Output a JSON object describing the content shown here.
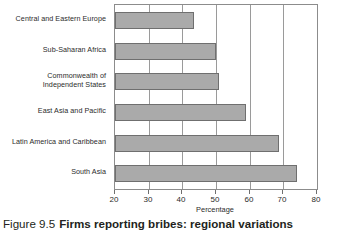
{
  "caption": {
    "number": "Figure 9.5",
    "text": "Firms reporting bribes: regional variations"
  },
  "chart_data": {
    "type": "bar",
    "orientation": "horizontal",
    "title": "",
    "xlabel": "Percentage",
    "ylabel": "",
    "xlim": [
      20,
      80
    ],
    "xticks": [
      20,
      30,
      40,
      50,
      60,
      70,
      80
    ],
    "xticklabels": [
      "20",
      "30",
      "40",
      "50",
      "60",
      "70",
      "80"
    ],
    "grid": true,
    "grid_axis": "x",
    "legend": false,
    "bar_color": "#aaaaaa",
    "bar_edge_color": "#6f6f6f",
    "categories": [
      "Central and Eastern Europe",
      "Sub-Saharan Africa",
      "Commonwealth of Independent States",
      "East Asia and Pacific",
      "Latin America and Caribbean",
      "South Asia"
    ],
    "category_lines": [
      [
        "Central and Eastern Europe"
      ],
      [
        "Sub-Saharan Africa"
      ],
      [
        "Commonwealth of",
        "Independent States"
      ],
      [
        "East Asia and Pacific"
      ],
      [
        "Latin America and Caribbean"
      ],
      [
        "South Asia"
      ]
    ],
    "values": [
      43.5,
      50,
      51,
      58.8,
      68.7,
      74
    ]
  }
}
